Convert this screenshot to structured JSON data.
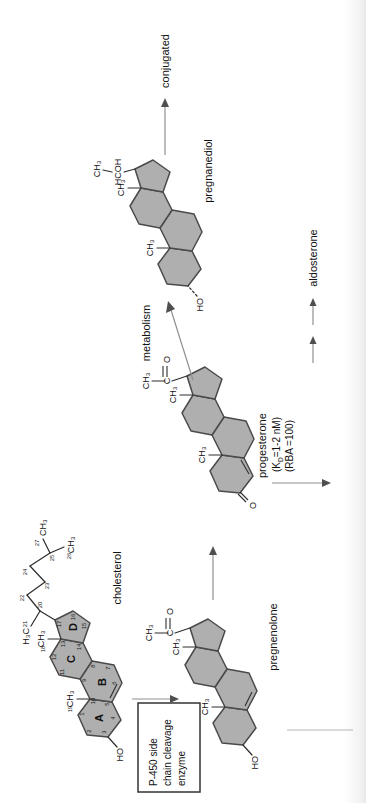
{
  "molecules": {
    "cholesterol": {
      "name": "cholesterol",
      "rings": [
        "A",
        "B",
        "C",
        "D"
      ],
      "carbons": [
        "1",
        "2",
        "3",
        "4",
        "5",
        "6",
        "7",
        "8",
        "9",
        "10",
        "11",
        "12",
        "13",
        "14",
        "15",
        "16",
        "17",
        "18",
        "19",
        "20",
        "21",
        "22",
        "23",
        "24",
        "25",
        "26",
        "27"
      ],
      "hydroxyl": "HO",
      "methyl": "CH₃",
      "methyl_reversed": "H₃C"
    },
    "pregnenolone": {
      "name": "pregnenolone",
      "hydroxyl": "HO",
      "methyl": "CH₃",
      "carbonyl_c": "C",
      "carbonyl_o": "O"
    },
    "progesterone": {
      "name": "progesterone",
      "affinity_prefix": "(K",
      "affinity_sub": "D",
      "affinity_suffix": "=1-2 nM)",
      "rba": "(RBA =100)",
      "ketone_o": "O",
      "methyl": "CH₃",
      "carbonyl_c": "C",
      "carbonyl_o": "O"
    },
    "pregnanediol": {
      "name": "pregnanediol",
      "hydroxyl": "HO",
      "methyl": "CH₃",
      "side_chain": "HCOH"
    }
  },
  "pathway": {
    "metabolism": "metabolism",
    "aldosterone": "aldosterone",
    "conjugated": "conjugated"
  },
  "enzyme_box": {
    "line1": "P-450 side",
    "line2": "chain cleavage",
    "line3": "enzyme"
  },
  "colors": {
    "ring_fill": "#afafaf",
    "ring_stroke": "#4a4a4a",
    "bond": "#2d2d2d",
    "arrow_shaft": "#909090",
    "arrow_head": "#4f4f4f",
    "text": "#111111"
  }
}
